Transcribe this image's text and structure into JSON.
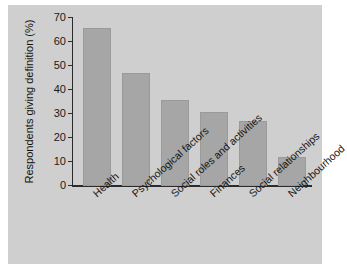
{
  "chart_data": {
    "type": "bar",
    "title": "",
    "xlabel": "",
    "ylabel": "Respondents giving definition (%)",
    "categories": [
      "Health",
      "Psychological factors",
      "Social roles and activities",
      "Finances",
      "Social relationships",
      "Neighbourhood"
    ],
    "values": [
      66,
      47,
      36,
      31,
      27,
      12
    ],
    "ylim": [
      0,
      70
    ],
    "yticks": [
      0,
      10,
      20,
      30,
      40,
      50,
      60,
      70
    ],
    "ytick_labels": [
      "0",
      "10",
      "20",
      "30",
      "40",
      "50",
      "60",
      "70"
    ],
    "grid": false,
    "legend": false,
    "bar_color": "#a6a6a6",
    "axis_color": "#2b2b2b",
    "figure_background": "#cfcfcf",
    "page_background": "#ffffff"
  }
}
